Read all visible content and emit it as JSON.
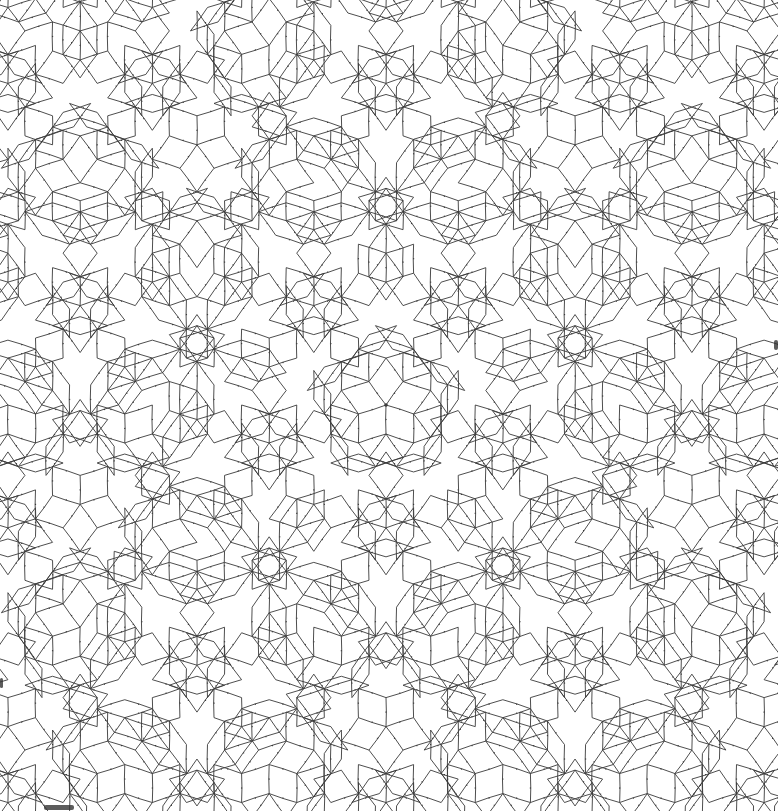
{
  "image": {
    "kind": "line-art tiling",
    "description": "Rhombic quasi-periodic tiling with 10-fold rotational star centered in the image",
    "width": 778,
    "height": 811,
    "background": "#ffffff",
    "stroke_color": "#3a3a3a",
    "stroke_width": 0.9,
    "center": [
      386,
      405
    ],
    "symmetry": 10,
    "grid_families": 5,
    "edge_length_px": 29
  }
}
